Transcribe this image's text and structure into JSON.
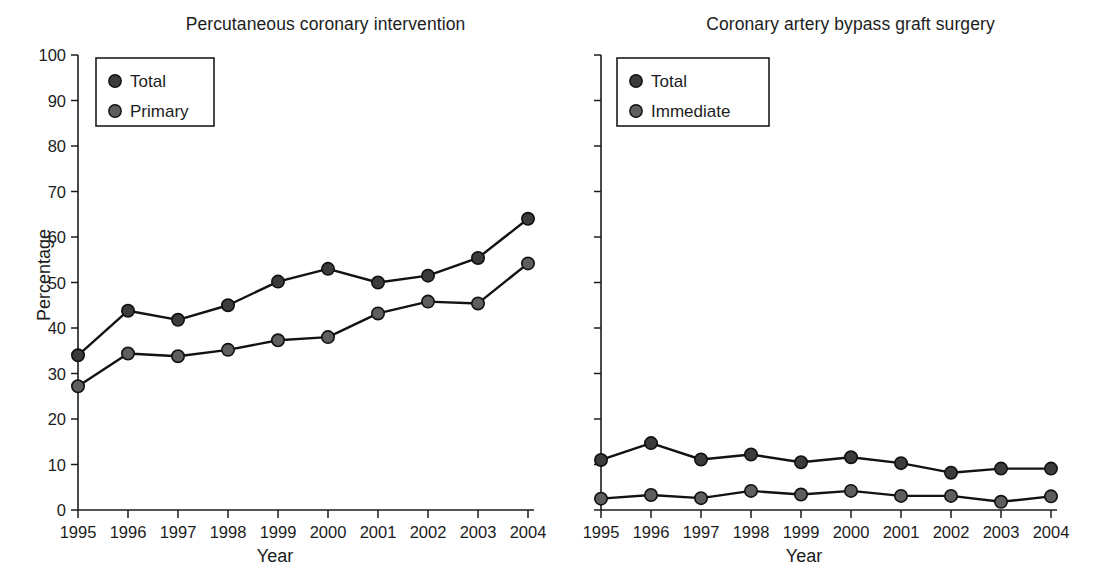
{
  "figure": {
    "width": 1118,
    "height": 585,
    "background": "#ffffff"
  },
  "chart_data": [
    {
      "type": "line",
      "title": "Percutaneous coronary intervention",
      "xlabel": "Year",
      "ylabel": "Percentage",
      "categories": [
        "1995",
        "1996",
        "1997",
        "1998",
        "1999",
        "2000",
        "2001",
        "2002",
        "2003",
        "2004"
      ],
      "x": [
        1995,
        1996,
        1997,
        1998,
        1999,
        2000,
        2001,
        2002,
        2003,
        2004
      ],
      "ylim": [
        0,
        100
      ],
      "yticks": [
        0,
        10,
        20,
        30,
        40,
        50,
        60,
        70,
        80,
        90,
        100
      ],
      "ytick_labels": [
        "0",
        "10",
        "20",
        "30",
        "40",
        "50",
        "60",
        "70",
        "80",
        "90",
        "100"
      ],
      "grid": false,
      "legend_position": "upper left",
      "series": [
        {
          "name": "Total",
          "color": "#3b3b3b",
          "marker": "circle",
          "values": [
            34.0,
            43.8,
            41.8,
            45.0,
            50.2,
            53.0,
            50.0,
            51.5,
            55.4,
            64.0
          ]
        },
        {
          "name": "Primary",
          "color": "#5e5e5e",
          "marker": "circle",
          "values": [
            27.2,
            34.4,
            33.8,
            35.2,
            37.3,
            38.0,
            43.2,
            45.8,
            45.4,
            54.2
          ]
        }
      ]
    },
    {
      "type": "line",
      "title": "Coronary artery bypass graft surgery",
      "xlabel": "Year",
      "ylabel": "",
      "categories": [
        "1995",
        "1996",
        "1997",
        "1998",
        "1999",
        "2000",
        "2001",
        "2002",
        "2003",
        "2004"
      ],
      "x": [
        1995,
        1996,
        1997,
        1998,
        1999,
        2000,
        2001,
        2002,
        2003,
        2004
      ],
      "ylim": [
        0,
        100
      ],
      "yticks": [
        0,
        10,
        20,
        30,
        40,
        50,
        60,
        70,
        80,
        90,
        100
      ],
      "ytick_labels": [
        "",
        "",
        "",
        "",
        "",
        "",
        "",
        "",
        "",
        "",
        ""
      ],
      "grid": false,
      "legend_position": "upper left",
      "series": [
        {
          "name": "Total",
          "color": "#3b3b3b",
          "marker": "circle",
          "values": [
            11.0,
            14.7,
            11.1,
            12.2,
            10.5,
            11.6,
            10.3,
            8.2,
            9.1,
            9.1
          ]
        },
        {
          "name": "Immediate",
          "color": "#5e5e5e",
          "marker": "circle",
          "values": [
            2.5,
            3.3,
            2.6,
            4.2,
            3.4,
            4.2,
            3.1,
            3.1,
            1.8,
            3.0
          ]
        }
      ]
    }
  ]
}
